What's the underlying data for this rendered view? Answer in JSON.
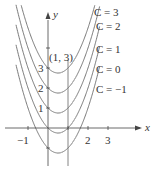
{
  "diagram": {
    "axes": {
      "x_label": "x",
      "y_label": "y",
      "x_ticks": [
        {
          "value": -1,
          "label": "−1"
        },
        {
          "value": 1,
          "label": ""
        },
        {
          "value": 2,
          "label": "2"
        },
        {
          "value": 3,
          "label": "3"
        }
      ],
      "y_ticks": [
        {
          "value": 1,
          "label": "1"
        },
        {
          "value": 2,
          "label": "2"
        },
        {
          "value": 3,
          "label": "3"
        },
        {
          "value": 4,
          "label": ""
        }
      ]
    },
    "point_label": "(1, 3)",
    "curves": [
      {
        "C": 3,
        "label": "C = 3"
      },
      {
        "C": 2,
        "label": "C = 2"
      },
      {
        "C": 1,
        "label": "C = 1"
      },
      {
        "C": 0,
        "label": "C = 0"
      },
      {
        "C": -1,
        "label": "C = −1"
      }
    ],
    "colors": {
      "curve": "#6b6b6b",
      "axis": "#444444",
      "tangent": "#b5b5b5",
      "text": "#333333"
    }
  }
}
